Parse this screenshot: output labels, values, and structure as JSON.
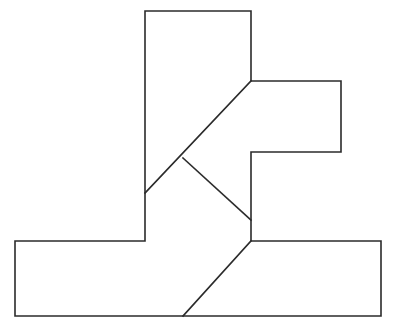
{
  "figure": {
    "kind": "line-drawing",
    "canvas": {
      "width": 395,
      "height": 336,
      "background": "#ffffff"
    },
    "stroke": {
      "color": "#2b2b2b",
      "width": 1.6
    },
    "fill": "#ffffff",
    "outline": {
      "name": "block-outline",
      "closed": true,
      "points": [
        [
          145,
          11
        ],
        [
          251,
          11
        ],
        [
          251,
          81
        ],
        [
          341,
          81
        ],
        [
          341,
          152
        ],
        [
          251,
          152
        ],
        [
          251,
          241
        ],
        [
          381,
          241
        ],
        [
          381,
          316
        ],
        [
          15,
          316
        ],
        [
          15,
          241
        ],
        [
          145,
          241
        ]
      ],
      "path": "M145,11 L251,11 L251,81 L341,81 L341,152 L251,152 L251,241 L381,241 L381,316 L15,316 L15,241 L145,241 Z"
    },
    "interior_lines": [
      {
        "name": "upper-diagonal",
        "from": [
          251,
          81
        ],
        "to": [
          145,
          193
        ],
        "path": "M251,81 L145,193"
      },
      {
        "name": "middle-diagonal",
        "from": [
          183,
          158
        ],
        "to": [
          251,
          220
        ],
        "path": "M183,158 L251,220"
      },
      {
        "name": "lower-diagonal",
        "from": [
          251,
          241
        ],
        "to": [
          183,
          316
        ],
        "path": "M251,241 L183,316"
      }
    ],
    "vertices": {
      "top_left": [
        145,
        11
      ],
      "top_right": [
        251,
        11
      ],
      "notch_corner": [
        251,
        81
      ],
      "right_arm_top_right": [
        341,
        81
      ],
      "right_arm_bottom_right": [
        341,
        152
      ],
      "right_arm_bottom_left": [
        251,
        152
      ],
      "base_step": [
        251,
        241
      ],
      "base_bottom_right": [
        381,
        316
      ],
      "base_bottom_left": [
        15,
        316
      ],
      "base_top_left": [
        15,
        241
      ],
      "column_base_left": [
        145,
        241
      ],
      "diag_on_left_edge": [
        145,
        193
      ],
      "v_apex_upper": [
        183,
        158
      ],
      "v_apex_lower": [
        251,
        220
      ],
      "diag_on_bottom_edge": [
        183,
        316
      ]
    }
  }
}
